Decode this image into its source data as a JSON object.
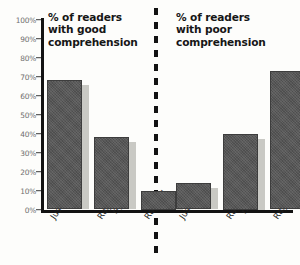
{
  "chart_data": {
    "type": "bar",
    "title": "",
    "xlabel": "",
    "ylabel": "",
    "ylim": [
      0,
      100
    ],
    "grid": false,
    "legend": "none",
    "categories": [
      "Justified",
      "Ragged right",
      "Ragged left"
    ],
    "panels": [
      {
        "title": "% of readers with good comprehension",
        "title_lines": [
          "% of readers",
          "with good",
          "comprehension"
        ],
        "values": [
          68,
          38,
          10
        ]
      },
      {
        "title": "% of readers with poor comprehension",
        "title_lines": [
          "% of readers",
          "with poor",
          "comprehension"
        ],
        "values": [
          14,
          40,
          73
        ]
      }
    ],
    "ytick_labels": [
      "100%",
      "90%",
      "80%",
      "70%",
      "60%",
      "50%",
      "40%",
      "30%",
      "20%",
      "10%",
      "0%"
    ],
    "ytick_values": [
      100,
      90,
      80,
      70,
      60,
      50,
      40,
      30,
      20,
      10,
      0
    ]
  },
  "category_lines": [
    [
      "Justified"
    ],
    [
      "Ragged",
      "right"
    ],
    [
      "Ragged",
      "left"
    ]
  ],
  "colors": {
    "bar": "#575757",
    "bar_border": "#3d3d3d",
    "bar_shadow": "#c9c9c4",
    "axis": "#121212",
    "tick_text": "#6e6e6e",
    "title_text": "#161616",
    "background": "#fdfdfb"
  }
}
